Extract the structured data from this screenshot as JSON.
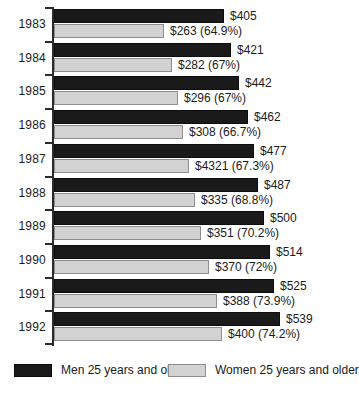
{
  "chart_data": {
    "type": "bar",
    "orientation": "horizontal",
    "title": "",
    "subtitle": "",
    "xlabel": "",
    "ylabel": "",
    "grid": false,
    "legend_position": "bottom",
    "categories": [
      "1983",
      "1984",
      "1985",
      "1986",
      "1987",
      "1988",
      "1989",
      "1990",
      "1991",
      "1992"
    ],
    "xlim": [
      0,
      560
    ],
    "series": [
      {
        "name": "Men 25 years and older",
        "color": "#1a1a1a",
        "values": [
          405,
          421,
          442,
          462,
          477,
          487,
          500,
          514,
          525,
          539
        ],
        "labels": [
          "$405",
          "$421",
          "$442",
          "$462",
          "$477",
          "$487",
          "$500",
          "$514",
          "$525",
          "$539"
        ]
      },
      {
        "name": "Women 25 years and older",
        "color": "#d2d2d2",
        "values": [
          263,
          282,
          296,
          308,
          321,
          335,
          351,
          370,
          388,
          400
        ],
        "labels": [
          "$263 (64.9%)",
          "$282 (67%)",
          "$296 (67%)",
          "$308 (66.7%)",
          "$4321 (67.3%)",
          "$335 (68.8%)",
          "$351 (70.2%)",
          "$370 (72%)",
          "$388 (73.9%)",
          "$400 (74.2%)"
        ],
        "percent_of_men": [
          64.9,
          67,
          67,
          66.7,
          67.3,
          68.8,
          70.2,
          72,
          73.9,
          74.2
        ]
      }
    ]
  },
  "legend": {
    "men_label": "Men 25 years and older",
    "women_label": "Women 25 years and older"
  }
}
